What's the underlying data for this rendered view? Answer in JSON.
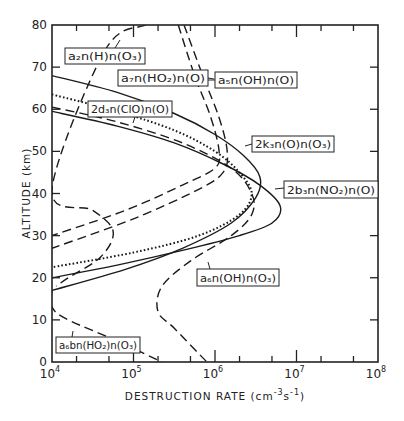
{
  "chart_data": {
    "type": "line",
    "title": "",
    "xlabel": "DESTRUCTION RATE (cm⁻³s⁻¹)",
    "ylabel": "ALTITUDE (km)",
    "xscale": "log",
    "xlim": [
      10000,
      100000000
    ],
    "ylim": [
      0,
      80
    ],
    "x_ticks": [
      "10^4",
      "10^5",
      "10^6",
      "10^7",
      "10^8"
    ],
    "y_ticks": [
      0,
      10,
      20,
      30,
      40,
      50,
      60,
      70,
      80
    ],
    "grid": false,
    "legend": "inline boxed labels",
    "series": [
      {
        "name": "2k3n(O)n(O3)",
        "style": "solid",
        "points_log10x_alt": [
          [
            4.0,
            68
          ],
          [
            4.8,
            64
          ],
          [
            5.5,
            59
          ],
          [
            6.0,
            54
          ],
          [
            6.35,
            49
          ],
          [
            6.55,
            44
          ],
          [
            6.5,
            39
          ],
          [
            6.2,
            33
          ],
          [
            5.6,
            27
          ],
          [
            4.9,
            22
          ],
          [
            4.0,
            17
          ]
        ]
      },
      {
        "name": "2b3n(NO2)n(O)",
        "style": "solid",
        "points_log10x_alt": [
          [
            4.0,
            59.5
          ],
          [
            4.8,
            56
          ],
          [
            5.5,
            52
          ],
          [
            6.1,
            47
          ],
          [
            6.55,
            42
          ],
          [
            6.8,
            37
          ],
          [
            6.7,
            33
          ],
          [
            6.3,
            30
          ],
          [
            5.6,
            26.5
          ],
          [
            4.8,
            23
          ],
          [
            4.0,
            20
          ]
        ]
      },
      {
        "name": "2d3n(ClO)n(O)",
        "style": "dotted",
        "points_log10x_alt": [
          [
            4.0,
            63.5
          ],
          [
            4.8,
            59.5
          ],
          [
            5.5,
            55
          ],
          [
            6.0,
            50
          ],
          [
            6.3,
            45
          ],
          [
            6.45,
            40
          ],
          [
            6.3,
            35
          ],
          [
            5.8,
            30
          ],
          [
            5.0,
            26
          ],
          [
            4.0,
            22.5
          ]
        ]
      },
      {
        "name": "a7n(HO2)n(O)",
        "style": "dashed",
        "points_log10x_alt": [
          [
            5.55,
            80
          ],
          [
            5.75,
            68
          ],
          [
            5.95,
            58
          ],
          [
            6.05,
            50
          ],
          [
            6.0,
            46
          ],
          [
            5.6,
            42
          ],
          [
            4.9,
            36
          ],
          [
            4.0,
            30
          ]
        ]
      },
      {
        "name": "a5n(OH)n(O)",
        "style": "dashed",
        "points_log10x_alt": [
          [
            5.62,
            80
          ],
          [
            5.85,
            68
          ],
          [
            6.05,
            58
          ],
          [
            6.15,
            50
          ],
          [
            6.1,
            45
          ],
          [
            5.8,
            41
          ],
          [
            5.0,
            34
          ],
          [
            4.0,
            27
          ]
        ]
      },
      {
        "name": "a2n(H)n(O3)",
        "style": "dashed",
        "points_log10x_alt": [
          [
            5.15,
            80
          ],
          [
            4.65,
            74
          ],
          [
            4.0,
            41
          ],
          [
            4.5,
            36
          ],
          [
            4.75,
            31
          ],
          [
            4.6,
            25
          ],
          [
            4.2,
            20
          ],
          [
            4.05,
            18
          ]
        ]
      },
      {
        "name": "a6n(OH)n(O3)",
        "style": "dashed",
        "points_log10x_alt": [
          [
            4.0,
            60.5
          ],
          [
            4.8,
            57
          ],
          [
            5.6,
            52
          ],
          [
            6.2,
            46
          ],
          [
            6.45,
            40
          ],
          [
            6.45,
            35
          ],
          [
            6.2,
            30
          ],
          [
            5.7,
            24
          ],
          [
            5.35,
            18
          ],
          [
            5.3,
            12
          ],
          [
            5.5,
            8
          ],
          [
            5.9,
            0
          ]
        ]
      },
      {
        "name": "a6bn(HO2)n(O3)",
        "style": "dashed",
        "points_log10x_alt": [
          [
            4.0,
            17
          ],
          [
            4.0,
            13
          ],
          [
            4.2,
            10
          ],
          [
            4.8,
            5
          ],
          [
            5.35,
            0
          ]
        ]
      }
    ]
  },
  "axes": {
    "y_label": "ALTITUDE (km)",
    "x_label_main": "DESTRUCTION RATE (cm",
    "x_label_sup1": "-3",
    "x_label_mid": "s",
    "x_label_sup2": "-1",
    "x_label_end": ")",
    "y_tick_labels": [
      "0",
      "10",
      "20",
      "30",
      "40",
      "50",
      "60",
      "70",
      "80"
    ],
    "x_tick_base": "10",
    "x_tick_exps": [
      "4",
      "5",
      "6",
      "7",
      "8"
    ]
  },
  "labels": [
    {
      "id": "a2",
      "text": "a₂n(H)n(O₃)"
    },
    {
      "id": "a7",
      "text": "a₇n(HO₂)n(O)"
    },
    {
      "id": "a5",
      "text": "a₅n(OH)n(O)"
    },
    {
      "id": "d3",
      "text": "2d₃n(ClO)n(O)"
    },
    {
      "id": "k3",
      "text": "2k₃n(O)n(O₃)"
    },
    {
      "id": "b3",
      "text": "2b₃n(NO₂)n(O)"
    },
    {
      "id": "a6",
      "text": "a₆n(OH)n(O₃)"
    },
    {
      "id": "a6b",
      "text": "a₆bn(HO₂)n(O₃)"
    }
  ]
}
